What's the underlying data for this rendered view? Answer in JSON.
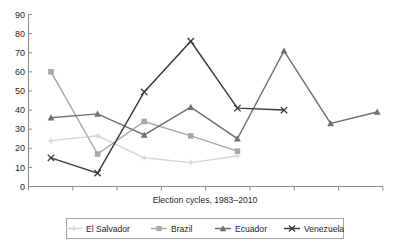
{
  "chart_data": {
    "type": "line",
    "title": "",
    "xlabel": "Election cycles, 1983–2010",
    "ylabel": "",
    "ylim": [
      0,
      90
    ],
    "ytick_labels": [
      "0",
      "10",
      "20",
      "30",
      "40",
      "50",
      "60",
      "70",
      "80",
      "90"
    ],
    "ytick_values": [
      0,
      10,
      20,
      30,
      40,
      50,
      60,
      70,
      80,
      90
    ],
    "xtick_labels": [
      "",
      "",
      "",
      "",
      "",
      "",
      "",
      "",
      ""
    ],
    "x_positions": [
      1,
      2,
      3,
      4,
      5,
      6,
      7,
      8,
      9
    ],
    "grid": false,
    "legend_position": "bottom",
    "series": [
      {
        "name": "El Salvador",
        "color": "#d6d6d6",
        "marker": "plus",
        "x": [
          1,
          2,
          3,
          4,
          5
        ],
        "values": [
          24,
          26.5,
          15,
          12.5,
          16
        ]
      },
      {
        "name": "Brazil",
        "color": "#a8a8a8",
        "marker": "square",
        "x": [
          1,
          2,
          3,
          4,
          5
        ],
        "values": [
          60,
          17,
          34,
          26.5,
          18.5
        ]
      },
      {
        "name": "Ecuador",
        "color": "#707070",
        "marker": "triangle",
        "x": [
          1,
          2,
          3,
          4,
          5,
          6,
          7,
          8
        ],
        "values": [
          36,
          38,
          27,
          41.5,
          25,
          71,
          33,
          39
        ]
      },
      {
        "name": "Venezuela",
        "color": "#3a3a3a",
        "marker": "cross",
        "x": [
          1,
          2,
          3,
          4,
          5,
          6
        ],
        "values": [
          15,
          7,
          49.5,
          76,
          41,
          40
        ]
      }
    ]
  },
  "axis": {
    "x_title": "Election cycles, 1983–2010",
    "y_labels": [
      "90",
      "80",
      "70",
      "60",
      "50",
      "40",
      "30",
      "20",
      "10",
      "0"
    ]
  },
  "legend": {
    "items": [
      {
        "label": "El Salvador",
        "color": "#d6d6d6",
        "marker": "plus"
      },
      {
        "label": "Brazil",
        "color": "#a8a8a8",
        "marker": "square"
      },
      {
        "label": "Ecuador",
        "color": "#707070",
        "marker": "triangle"
      },
      {
        "label": "Venezuela",
        "color": "#3a3a3a",
        "marker": "cross"
      }
    ]
  }
}
